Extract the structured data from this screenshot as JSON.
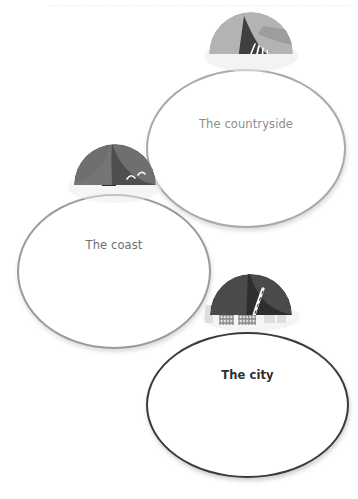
{
  "page": {
    "background_color": "#ffffff",
    "divider": {
      "name": "dotted-rule",
      "color": "#d8d8d8",
      "style": "dotted"
    }
  },
  "diagram": {
    "type": "bubble-map",
    "title": "",
    "nodes": [
      {
        "id": "countryside",
        "label": "The countryside",
        "label_color": "#8d8d8d",
        "outline_color": "#a9a9a9",
        "icon": "countryside-icon",
        "icon_parts": [
          "tree-left",
          "tree-right",
          "hill-light",
          "field-dark",
          "road-lines"
        ],
        "colors": {
          "hill": "#b3b3b3",
          "field": "#3f3f3f",
          "foliage": "#9b9b9b",
          "road": "#ffffff"
        }
      },
      {
        "id": "coast",
        "label": "The coast",
        "label_color": "#6e6e6e",
        "outline_color": "#9a9a9a",
        "icon": "coast-icon",
        "icon_parts": [
          "lighthouse",
          "bird",
          "headland",
          "sea",
          "waves"
        ],
        "colors": {
          "land": "#6f6f6f",
          "sea": "#4f4f4f",
          "lighthouse_dark": "#2b2b2b",
          "lighthouse_light": "#ffffff",
          "waves": "#ffffff"
        }
      },
      {
        "id": "city",
        "label": "The city",
        "label_color": "#2f2f2f",
        "outline_color": "#3b3b3b",
        "icon": "city-icon",
        "icon_parts": [
          "tower-left",
          "tower-right",
          "skyline-faint",
          "ground",
          "road",
          "road-dashes"
        ],
        "colors": {
          "ground_left": "#4a4a4a",
          "ground_right": "#2e2e2e",
          "tower_left": "#8d8d8d",
          "tower_right": "#8d8d8d",
          "road": "#ffffff"
        }
      }
    ]
  }
}
